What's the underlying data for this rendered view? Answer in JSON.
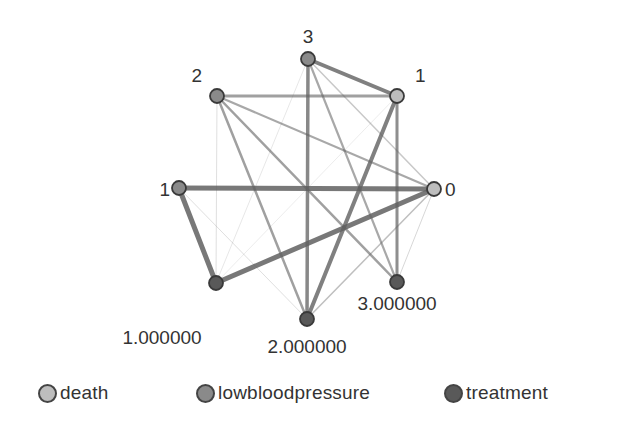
{
  "colors": {
    "death": "#bdbdbd",
    "lowbloodpressure": "#8a8a8a",
    "treatment": "#595959",
    "edge": "#606060",
    "label": "#333333"
  },
  "nodes": [
    {
      "id": "death_0",
      "variable": "death",
      "label": "0",
      "x": 434,
      "y": 189,
      "label_x": 445,
      "label_y": 196,
      "anchor": "start"
    },
    {
      "id": "death_1",
      "variable": "death",
      "label": "1",
      "x": 397,
      "y": 96,
      "label_x": 415,
      "label_y": 82,
      "anchor": "start"
    },
    {
      "id": "lbp_1",
      "variable": "lowbloodpressure",
      "label": "1",
      "x": 179,
      "y": 188,
      "label_x": 170,
      "label_y": 196,
      "anchor": "end"
    },
    {
      "id": "lbp_2",
      "variable": "lowbloodpressure",
      "label": "2",
      "x": 217,
      "y": 96,
      "label_x": 202,
      "label_y": 82,
      "anchor": "end"
    },
    {
      "id": "lbp_3",
      "variable": "lowbloodpressure",
      "label": "3",
      "x": 308,
      "y": 59,
      "label_x": 308,
      "label_y": 43,
      "anchor": "middle"
    },
    {
      "id": "trt_1",
      "variable": "treatment",
      "label": "1.000000",
      "x": 216,
      "y": 283,
      "label_x": 162,
      "label_y": 344,
      "anchor": "middle"
    },
    {
      "id": "trt_2",
      "variable": "treatment",
      "label": "2.000000",
      "x": 307,
      "y": 319,
      "label_x": 307,
      "label_y": 353,
      "anchor": "middle"
    },
    {
      "id": "trt_3",
      "variable": "treatment",
      "label": "3.000000",
      "x": 397,
      "y": 282,
      "label_x": 397,
      "label_y": 310,
      "anchor": "middle"
    }
  ],
  "edges": [
    {
      "from": "lbp_1",
      "to": "death_0",
      "width": 5,
      "opacity": 0.85
    },
    {
      "from": "trt_1",
      "to": "death_0",
      "width": 5,
      "opacity": 0.85
    },
    {
      "from": "lbp_1",
      "to": "trt_1",
      "width": 5,
      "opacity": 0.85
    },
    {
      "from": "lbp_3",
      "to": "death_1",
      "width": 4,
      "opacity": 0.8
    },
    {
      "from": "death_1",
      "to": "trt_2",
      "width": 4,
      "opacity": 0.8
    },
    {
      "from": "lbp_3",
      "to": "trt_2",
      "width": 3.5,
      "opacity": 0.75
    },
    {
      "from": "death_1",
      "to": "trt_3",
      "width": 3,
      "opacity": 0.7
    },
    {
      "from": "lbp_2",
      "to": "death_1",
      "width": 3,
      "opacity": 0.6
    },
    {
      "from": "lbp_2",
      "to": "trt_2",
      "width": 2.5,
      "opacity": 0.6
    },
    {
      "from": "lbp_2",
      "to": "trt_3",
      "width": 2.5,
      "opacity": 0.6
    },
    {
      "from": "lbp_2",
      "to": "death_0",
      "width": 2.2,
      "opacity": 0.55
    },
    {
      "from": "lbp_3",
      "to": "trt_3",
      "width": 2.2,
      "opacity": 0.55
    },
    {
      "from": "lbp_3",
      "to": "death_0",
      "width": 1.5,
      "opacity": 0.35
    },
    {
      "from": "trt_2",
      "to": "death_0",
      "width": 1.5,
      "opacity": 0.4
    },
    {
      "from": "trt_3",
      "to": "death_0",
      "width": 1,
      "opacity": 0.25
    },
    {
      "from": "lbp_2",
      "to": "trt_1",
      "width": 1,
      "opacity": 0.2
    },
    {
      "from": "lbp_1",
      "to": "trt_2",
      "width": 1,
      "opacity": 0.2
    },
    {
      "from": "trt_1",
      "to": "lbp_3",
      "width": 1,
      "opacity": 0.15
    },
    {
      "from": "trt_1",
      "to": "death_1",
      "width": 1,
      "opacity": 0.12
    }
  ],
  "legend": {
    "items": [
      {
        "label": "death",
        "swatch_x": 38,
        "label_x": 60
      },
      {
        "label": "lowbloodpressure",
        "swatch_x": 196,
        "label_x": 218
      },
      {
        "label": "treatment",
        "swatch_x": 444,
        "label_x": 466
      }
    ]
  }
}
